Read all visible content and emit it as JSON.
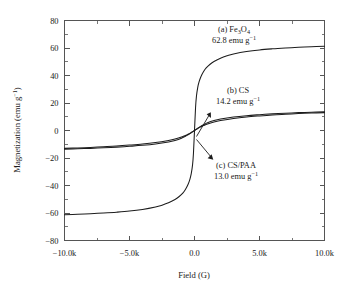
{
  "chart_data": {
    "type": "line",
    "title": "",
    "xlabel": "Field (G)",
    "ylabel": "Magnetization (emu g⁻¹)",
    "xlim": [
      -10000,
      10000
    ],
    "ylim": [
      -80,
      80
    ],
    "grid": false,
    "legend_position": "in-plot annotations",
    "x_ticks": [
      -10000,
      -5000,
      0,
      5000,
      10000
    ],
    "x_tick_labels": [
      "−10.0k",
      "−5.0k",
      "0.0",
      "5.0k",
      "10.0k"
    ],
    "y_ticks": [
      -80,
      -60,
      -40,
      -20,
      0,
      20,
      40,
      60,
      80
    ],
    "y_tick_labels": [
      "−80",
      "−60",
      "−40",
      "−20",
      "0",
      "20",
      "40",
      "60",
      "80"
    ],
    "x_minor_interval": 2500,
    "y_minor_interval": 10,
    "series": [
      {
        "name": "(a) Fe3O4",
        "saturation": 62.8,
        "saturation_unit": "emu g⁻¹",
        "x": [
          -10000,
          -9000,
          -8000,
          -7000,
          -6000,
          -5000,
          -4000,
          -3000,
          -2500,
          -2000,
          -1500,
          -1200,
          -900,
          -700,
          -500,
          -350,
          -250,
          -150,
          -80,
          0,
          80,
          150,
          250,
          350,
          500,
          700,
          900,
          1200,
          1500,
          2000,
          2500,
          3000,
          4000,
          5000,
          6000,
          7000,
          8000,
          9000,
          10000
        ],
        "y": [
          -61.2,
          -60.9,
          -60.5,
          -60.0,
          -59.4,
          -58.6,
          -57.4,
          -55.6,
          -54.3,
          -52.6,
          -50.2,
          -48.2,
          -45.5,
          -42.9,
          -39.3,
          -35.3,
          -31.4,
          -25.0,
          -16.5,
          0.0,
          16.5,
          25.0,
          31.4,
          35.3,
          39.3,
          42.9,
          45.5,
          48.2,
          50.2,
          52.6,
          54.3,
          55.6,
          57.4,
          58.6,
          59.4,
          60.0,
          60.5,
          60.9,
          61.2
        ]
      },
      {
        "name": "(b) CS",
        "saturation": 14.2,
        "saturation_unit": "emu g⁻¹",
        "x": [
          -10000,
          -9000,
          -8000,
          -7000,
          -6000,
          -5000,
          -4000,
          -3000,
          -2000,
          -1500,
          -1000,
          -700,
          -500,
          -300,
          -150,
          0,
          150,
          300,
          500,
          700,
          1000,
          1500,
          2000,
          3000,
          4000,
          5000,
          6000,
          7000,
          8000,
          9000,
          10000
        ],
        "y": [
          -13.6,
          -13.3,
          -13.0,
          -12.6,
          -12.1,
          -11.5,
          -10.8,
          -9.8,
          -8.3,
          -7.2,
          -5.6,
          -4.2,
          -3.2,
          -2.0,
          -1.0,
          0.0,
          1.0,
          2.0,
          3.2,
          4.2,
          5.6,
          7.2,
          8.3,
          9.8,
          10.8,
          11.5,
          12.1,
          12.6,
          13.0,
          13.3,
          13.6
        ]
      },
      {
        "name": "(c) CS/PAA",
        "saturation": 13.0,
        "saturation_unit": "emu g⁻¹",
        "x": [
          -10000,
          -9000,
          -8000,
          -7000,
          -6000,
          -5000,
          -4000,
          -3000,
          -2000,
          -1500,
          -1000,
          -700,
          -500,
          -300,
          -150,
          0,
          150,
          300,
          500,
          700,
          1000,
          1500,
          2000,
          3000,
          4000,
          5000,
          6000,
          7000,
          8000,
          9000,
          10000
        ],
        "y": [
          -13.0,
          -12.7,
          -12.3,
          -11.8,
          -11.3,
          -10.6,
          -9.8,
          -8.7,
          -7.2,
          -6.2,
          -4.8,
          -3.6,
          -2.7,
          -1.7,
          -0.85,
          0.0,
          0.85,
          1.7,
          2.7,
          3.6,
          4.8,
          6.2,
          7.2,
          8.7,
          9.8,
          10.6,
          11.3,
          11.8,
          12.3,
          12.7,
          13.0
        ]
      }
    ],
    "annotations": [
      {
        "id": "label-fe3o4",
        "line1_prefix": "(a) Fe",
        "line1_sub1": "3",
        "line1_mid": "O",
        "line1_sub2": "4",
        "line2_value": "62.8 emu g",
        "line2_sup": "−1"
      },
      {
        "id": "label-cs",
        "line1": "(b) CS",
        "line2_value": "14.2 emu g",
        "line2_sup": "−1"
      },
      {
        "id": "label-cspaa",
        "line1": "(c) CS/PAA",
        "line2_value": "13.0 emu g",
        "line2_sup": "−1"
      }
    ]
  }
}
